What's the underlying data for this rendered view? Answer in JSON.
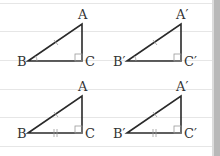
{
  "figures": [
    {
      "id": "top-left",
      "labels": {
        "A": "A",
        "B": "B",
        "C": "C"
      },
      "marks": {
        "hypotenuse": "single-tick",
        "base": "none",
        "angle_B": "single-arc",
        "angle_C": "right-angle"
      }
    },
    {
      "id": "top-right",
      "labels": {
        "A": "A′",
        "B": "B′",
        "C": "C′"
      },
      "marks": {
        "hypotenuse": "single-tick",
        "base": "none",
        "angle_B": "single-arc",
        "angle_C": "right-angle"
      }
    },
    {
      "id": "bottom-left",
      "labels": {
        "A": "A",
        "B": "B",
        "C": "C"
      },
      "marks": {
        "hypotenuse": "single-tick",
        "base": "double-tick",
        "angle_B": "none",
        "angle_C": "right-angle"
      }
    },
    {
      "id": "bottom-right",
      "labels": {
        "A": "A′",
        "B": "B′",
        "C": "C′"
      },
      "marks": {
        "hypotenuse": "single-tick",
        "base": "double-tick",
        "angle_B": "none",
        "angle_C": "right-angle"
      }
    }
  ],
  "colors": {
    "stroke": "#2a2a2a",
    "mark": "#9a9a9a",
    "rule": "#e6e6e6",
    "label": "#333333"
  }
}
